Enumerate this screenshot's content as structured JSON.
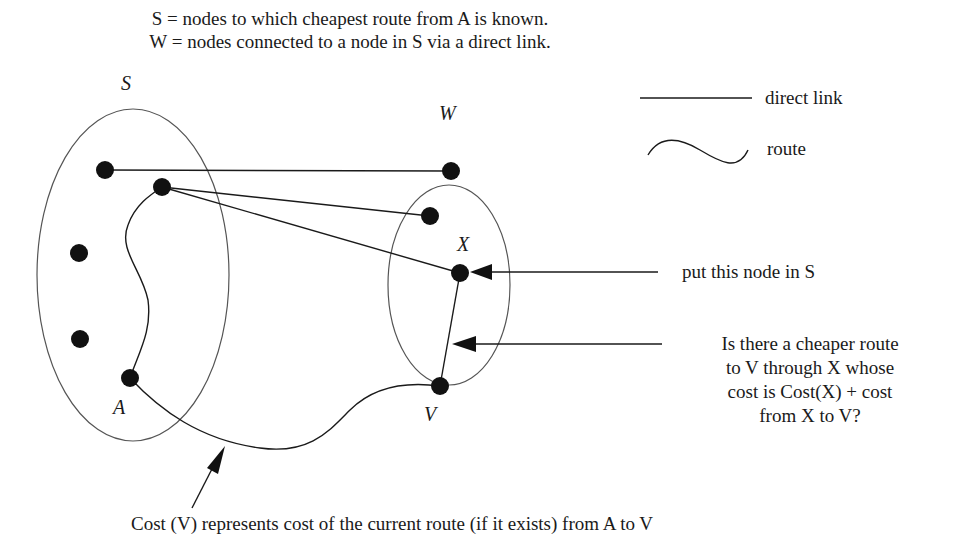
{
  "header": {
    "line1": "S = nodes to which cheapest route from A is known.",
    "line2": "W = nodes connected to a node in S via a direct link."
  },
  "sets": {
    "S": {
      "label": "S",
      "cx": 133,
      "cy": 275,
      "rx": 96,
      "ry": 166
    },
    "W": {
      "label": "W",
      "cx": 449,
      "cy": 285,
      "rx": 61,
      "ry": 100
    }
  },
  "nodes": [
    {
      "id": "s1",
      "x": 105,
      "y": 170,
      "set": "S"
    },
    {
      "id": "s2",
      "x": 162,
      "y": 187,
      "set": "S"
    },
    {
      "id": "s3",
      "x": 79,
      "y": 253,
      "set": "S"
    },
    {
      "id": "s4",
      "x": 80,
      "y": 339,
      "set": "S"
    },
    {
      "id": "A",
      "x": 130,
      "y": 378,
      "set": "S",
      "label": "A"
    },
    {
      "id": "w1",
      "x": 451,
      "y": 171,
      "set": "W"
    },
    {
      "id": "w2",
      "x": 430,
      "y": 216,
      "set": "W"
    },
    {
      "id": "X",
      "x": 460,
      "y": 273,
      "set": "W",
      "label": "X"
    },
    {
      "id": "V",
      "x": 440,
      "y": 386,
      "label": "V"
    }
  ],
  "edges": {
    "direct_links": [
      [
        "s1",
        "w1"
      ],
      [
        "s2",
        "w2"
      ],
      [
        "s2",
        "X"
      ],
      [
        "X",
        "V"
      ]
    ],
    "routes": [
      [
        "A",
        "s2"
      ],
      [
        "A",
        "V"
      ]
    ]
  },
  "labels": {
    "A": "A",
    "X": "X",
    "V": "V"
  },
  "legend": {
    "direct_link": "direct link",
    "route": "route"
  },
  "annotations": {
    "put_in_S": "put this node in S",
    "cheaper_route": [
      "Is there a cheaper route",
      "to V through X whose",
      "cost is Cost(X) + cost",
      "from X to V?"
    ],
    "cost_v": "Cost (V) represents cost of the current route (if it exists) from A to V"
  },
  "colors": {
    "stroke": "#1a1a1a",
    "ellipse": "#555555",
    "node": "#111111"
  }
}
